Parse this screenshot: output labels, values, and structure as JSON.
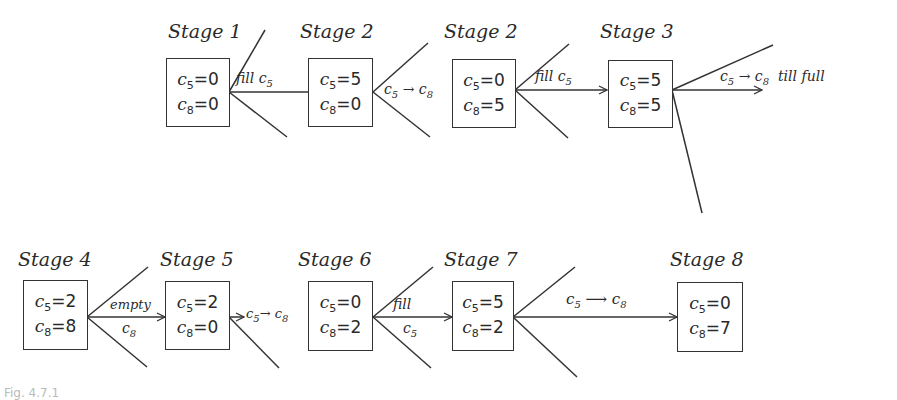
{
  "diagram": {
    "type": "state-transition tree (water jug problem, 5 and 8 liter jugs)",
    "stages": [
      {
        "id": "s1",
        "title": "Stage 1",
        "c5": "0",
        "c8": "0"
      },
      {
        "id": "s2",
        "title": "Stage 2",
        "c5": "5",
        "c8": "0"
      },
      {
        "id": "s2b",
        "title": "Stage 2",
        "c5": "0",
        "c8": "5"
      },
      {
        "id": "s3",
        "title": "Stage 3",
        "c5": "5",
        "c8": "5"
      },
      {
        "id": "s4",
        "title": "Stage 4",
        "c5": "2",
        "c8": "8"
      },
      {
        "id": "s5",
        "title": "Stage 5",
        "c5": "2",
        "c8": "0"
      },
      {
        "id": "s6",
        "title": "Stage 6",
        "c5": "0",
        "c8": "2"
      },
      {
        "id": "s7",
        "title": "Stage 7",
        "c5": "5",
        "c8": "2"
      },
      {
        "id": "s8",
        "title": "Stage 8",
        "c5": "0",
        "c8": "7"
      }
    ],
    "transitions": [
      {
        "from": "s1",
        "to": "s2",
        "label": "fill c5"
      },
      {
        "from": "s2",
        "to": "s2b",
        "label": "c5 → c8"
      },
      {
        "from": "s2b",
        "to": "s3",
        "label": "fill c5"
      },
      {
        "from": "s3",
        "to": "s4",
        "label": "c5 → c8 till full"
      },
      {
        "from": "s4",
        "to": "s5",
        "label": "empty c8"
      },
      {
        "from": "s5",
        "to": "s6",
        "label": "c5 → c8"
      },
      {
        "from": "s6",
        "to": "s7",
        "label": "fill c5"
      },
      {
        "from": "s7",
        "to": "s8",
        "label": "c5 → c8"
      }
    ],
    "var_c5": "c",
    "sub5": "5",
    "sub8": "8",
    "eq": "=",
    "arrow": "→",
    "long_arrow": "⟶",
    "labels": {
      "fill": "fill",
      "till_full": "till full",
      "empty": "empty"
    },
    "caption": "Fig. 4.7.1"
  }
}
